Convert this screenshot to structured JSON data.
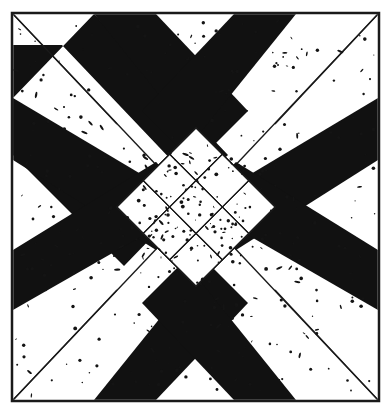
{
  "figure": {
    "title": "Geometric star quilt block diagram",
    "type": "line-drawing",
    "width": 388,
    "height": 417,
    "background_color": "#ffffff",
    "fill_color": "#111111",
    "line_color": "#1a1a1a",
    "speckle_color": "#161616"
  },
  "frame": {
    "name": "outer-border",
    "x": 12,
    "y": 13,
    "width": 367,
    "height": 388,
    "stroke_width": 2.5,
    "stroke_color": "#1a1a1a",
    "fill": "none"
  },
  "center": {
    "name": "center-diamond-lattice",
    "center_x": 196,
    "center_y": 207,
    "rows": 3,
    "cols": 3,
    "cell_half_diagonal": 26.5,
    "rotation_deg": 45,
    "stroke_width": 1.2,
    "cells_filled": 9,
    "label": "3 by 3 rotated diamond grid"
  },
  "geometry": {
    "black_bands": [
      {
        "name": "band-top-left-to-center",
        "direction": "NW-SE"
      },
      {
        "name": "band-top-right-to-center",
        "direction": "NE-SW"
      },
      {
        "name": "band-bottom-left-to-center",
        "direction": "SW-NE"
      },
      {
        "name": "band-bottom-right-to-center",
        "direction": "SE-NW"
      },
      {
        "name": "band-left-upper-horizontal-wedge",
        "direction": "W"
      },
      {
        "name": "band-left-lower-horizontal-wedge",
        "direction": "W"
      },
      {
        "name": "band-right-upper-horizontal-wedge",
        "direction": "E"
      },
      {
        "name": "band-right-lower-horizontal-wedge",
        "direction": "E"
      }
    ],
    "corner_outline_diagonals": [
      {
        "name": "corner-line-top-left"
      },
      {
        "name": "corner-line-top-right"
      },
      {
        "name": "corner-line-bottom-left"
      },
      {
        "name": "corner-line-bottom-right"
      }
    ],
    "key_points": {
      "top_wedge_left_x": 94,
      "top_wedge_right_x": 295,
      "side_band_top_y": 98,
      "side_band_bottom_y": 310
    }
  },
  "texture": {
    "name": "speckle-texture",
    "dot_count": 430,
    "dot_radius_min": 0.6,
    "dot_radius_max": 1.9,
    "color": "#141414",
    "seed": 20240917,
    "note": "Random ink speckles scattered across the white background areas, denser near the centre panels."
  }
}
